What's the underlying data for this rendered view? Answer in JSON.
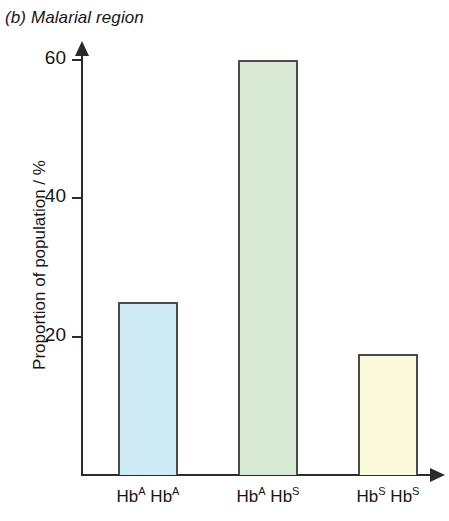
{
  "chart_data": {
    "type": "bar",
    "title": "(b) Malarial region",
    "xlabel": "",
    "ylabel": "Proportion of population / %",
    "categories": [
      "HbA HbA",
      "HbA HbS",
      "HbS HbS"
    ],
    "category_labels_rich": [
      {
        "base1": "Hb",
        "sup1": "A",
        "base2": "Hb",
        "sup2": "A"
      },
      {
        "base1": "Hb",
        "sup1": "A",
        "base2": "Hb",
        "sup2": "S"
      },
      {
        "base1": "Hb",
        "sup1": "S",
        "base2": "Hb",
        "sup2": "S"
      }
    ],
    "values": [
      25,
      60,
      17.5
    ],
    "ylim": [
      0,
      63
    ],
    "yticks": [
      20,
      40,
      60
    ],
    "ytick_labels": [
      "20",
      "40",
      "60"
    ],
    "grid": false,
    "legend": "none",
    "bar_colors": [
      "#cdeaf5",
      "#d7e8d3",
      "#fbfbdc"
    ],
    "bar_border_color": "#4b4b4b",
    "axis_color": "#2b2b2b"
  }
}
